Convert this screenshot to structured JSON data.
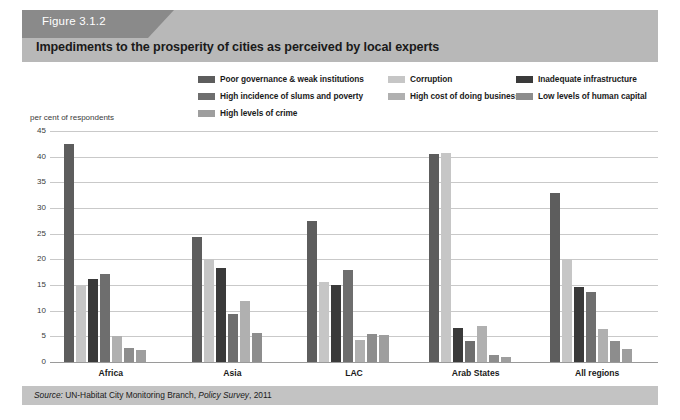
{
  "header": {
    "figure_tab_label": "Figure 3.1.2",
    "title": "Impediments to the prosperity of cities as perceived by local experts",
    "band_color": "#b8b8b8",
    "tab_color": "#8a8a8a"
  },
  "footer": {
    "source_prefix": "Source:",
    "source_body": " UN-Habitat City Monitoring Branch, ",
    "source_italic": "Policy Survey",
    "source_suffix": ", 2011",
    "band_color": "#c3c3c3"
  },
  "chart_data": {
    "type": "bar",
    "title": "Impediments to the prosperity of cities as perceived by local experts",
    "xlabel": "",
    "ylabel": "per cent of respondents",
    "ylim": [
      0,
      45
    ],
    "ytick_step": 5,
    "yticks": [
      45,
      40,
      35,
      30,
      25,
      20,
      15,
      10,
      5,
      0
    ],
    "grid": true,
    "legend_position": "top",
    "categories": [
      "Africa",
      "Asia",
      "LAC",
      "Arab States",
      "All regions"
    ],
    "series": [
      {
        "name": "Poor governance & weak institutions",
        "color": "#5d5d5d",
        "values": [
          42.5,
          24.3,
          27.5,
          40.5,
          33.0
        ]
      },
      {
        "name": "Corruption",
        "color": "#c6c6c6",
        "values": [
          15.1,
          20.0,
          15.5,
          40.7,
          20.0
        ]
      },
      {
        "name": "Inadequate infrastructure",
        "color": "#3a3a3a",
        "values": [
          16.1,
          18.3,
          15.0,
          6.7,
          14.7
        ]
      },
      {
        "name": "High incidence of slums and poverty",
        "color": "#6e6e6e",
        "values": [
          17.1,
          9.3,
          18.0,
          4.0,
          13.7
        ]
      },
      {
        "name": "High cost of doing business",
        "color": "#b0b0b0",
        "values": [
          5.0,
          11.8,
          4.3,
          7.0,
          6.5
        ]
      },
      {
        "name": "Low levels of human capital",
        "color": "#8d8d8d",
        "values": [
          2.8,
          5.7,
          5.5,
          1.3,
          4.0
        ]
      },
      {
        "name": "High levels of crime",
        "color": "#9e9e9e",
        "values": [
          2.3,
          0,
          5.3,
          1.0,
          2.5
        ]
      }
    ]
  }
}
